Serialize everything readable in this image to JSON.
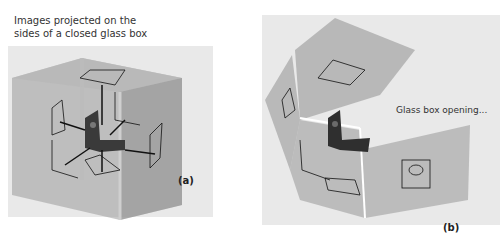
{
  "panel_a": {
    "caption_line1": "Images projected on the",
    "caption_line2": "sides of a closed glass box",
    "label": "(a)"
  },
  "panel_b": {
    "caption": "Glass box opening...",
    "label": "(b)"
  },
  "colors": {
    "background": "#e9e9e9",
    "glass": "#8a8a8a",
    "part": "#3a3a3a",
    "line": "#111111"
  }
}
